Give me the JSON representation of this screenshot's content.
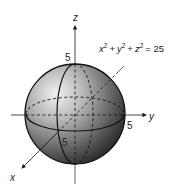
{
  "diagram": {
    "equation": {
      "x": "x",
      "y": "y",
      "z": "z",
      "exp": "2",
      "plus": "+",
      "equals": "= 25"
    },
    "axes": {
      "x_label": "x",
      "y_label": "y",
      "z_label": "z"
    },
    "ticks": {
      "z_tick": "5",
      "y_tick": "5",
      "x_tick": "5"
    },
    "colors": {
      "sphere_light": "#e6e6e6",
      "sphere_mid": "#8a8a8a",
      "sphere_dark": "#2a2a2a",
      "line": "#111111",
      "axis": "#333333"
    }
  }
}
